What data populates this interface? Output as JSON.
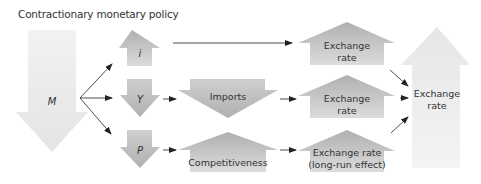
{
  "title": "Contractionary monetary policy",
  "nodes": {
    "money": {
      "label": "M",
      "direction": "down"
    },
    "interest": {
      "label": "i",
      "direction": "up"
    },
    "income": {
      "label": "Y",
      "direction": "down"
    },
    "prices": {
      "label": "P",
      "direction": "down"
    },
    "imports": {
      "label": "Imports",
      "direction": "down"
    },
    "competitiveness": {
      "label": "Competitiveness",
      "direction": "up"
    },
    "exchange_rate_1": {
      "line1": "Exchange",
      "line2": "rate",
      "direction": "up"
    },
    "exchange_rate_2": {
      "line1": "Exchange",
      "line2": "rate",
      "direction": "up"
    },
    "exchange_rate_3": {
      "line1": "Exchange rate",
      "line2": "(long-run effect)",
      "direction": "up"
    },
    "exchange_rate_final": {
      "line1": "Exchange",
      "line2": "rate",
      "direction": "up"
    }
  },
  "colors": {
    "arrow_dark": "#bdbdbd",
    "arrow_light": "#e6e6e6",
    "line": "#222222"
  }
}
